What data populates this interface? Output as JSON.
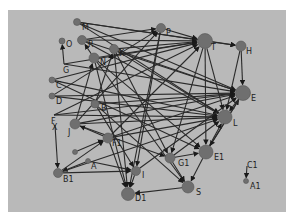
{
  "diagram": {
    "type": "directed-network-graph",
    "background": "#b9b9b9",
    "node_color": "#6f6f6f",
    "edge_color": "#2a2a2a",
    "nodes": [
      {
        "id": "M",
        "label": "M",
        "x": 77,
        "y": 22,
        "r": 3.5,
        "lx": 82,
        "ly": 30
      },
      {
        "id": "O",
        "label": "O",
        "x": 62,
        "y": 41,
        "r": 3.0,
        "lx": 66,
        "ly": 47
      },
      {
        "id": "R",
        "label": "R",
        "x": 82,
        "y": 40,
        "r": 4.5,
        "lx": 88,
        "ly": 47
      },
      {
        "id": "K",
        "label": "K",
        "x": 114,
        "y": 49,
        "r": 4.5,
        "lx": 119,
        "ly": 56
      },
      {
        "id": "N",
        "label": "N",
        "x": 94,
        "y": 58,
        "r": 5.0,
        "lx": 100,
        "ly": 65
      },
      {
        "id": "P",
        "label": "P",
        "x": 161,
        "y": 28,
        "r": 4.5,
        "lx": 166,
        "ly": 35
      },
      {
        "id": "T",
        "label": "T",
        "x": 205,
        "y": 41,
        "r": 7.5,
        "lx": 211,
        "ly": 50
      },
      {
        "id": "H",
        "label": "H",
        "x": 241,
        "y": 46,
        "r": 5.0,
        "lx": 246,
        "ly": 54
      },
      {
        "id": "E",
        "label": "E",
        "x": 243,
        "y": 93,
        "r": 7.5,
        "lx": 251,
        "ly": 101
      },
      {
        "id": "L",
        "label": "L",
        "x": 225,
        "y": 117,
        "r": 7.0,
        "lx": 233,
        "ly": 126
      },
      {
        "id": "G",
        "label": "G",
        "x": 64,
        "y": 64,
        "r": 0,
        "lx": 63,
        "ly": 73
      },
      {
        "id": "C",
        "label": "C",
        "x": 52,
        "y": 80,
        "r": 3.0,
        "lx": 56,
        "ly": 88
      },
      {
        "id": "D",
        "label": "D",
        "x": 52,
        "y": 96,
        "r": 3.0,
        "lx": 56,
        "ly": 104
      },
      {
        "id": "B",
        "label": "B",
        "x": 95,
        "y": 104,
        "r": 4.0,
        "lx": 101,
        "ly": 111
      },
      {
        "id": "F",
        "label": "F",
        "x": 54,
        "y": 115,
        "r": 0,
        "lx": 51,
        "ly": 124
      },
      {
        "id": "X",
        "label": "X",
        "x": 55,
        "y": 125,
        "r": 0,
        "lx": 52,
        "ly": 130
      },
      {
        "id": "J",
        "label": "J",
        "x": 75,
        "y": 124,
        "r": 5.0,
        "lx": 68,
        "ly": 135
      },
      {
        "id": "F1",
        "label": "F1",
        "x": 108,
        "y": 138,
        "r": 5.0,
        "lx": 112,
        "ly": 146
      },
      {
        "id": "Q",
        "label": "",
        "x": 75,
        "y": 152,
        "r": 2.5,
        "lx": 0,
        "ly": 0
      },
      {
        "id": "A",
        "label": "A",
        "x": 88,
        "y": 161,
        "r": 2.5,
        "lx": 91,
        "ly": 169
      },
      {
        "id": "B1",
        "label": "B1",
        "x": 58,
        "y": 173,
        "r": 4.5,
        "lx": 63,
        "ly": 182
      },
      {
        "id": "I",
        "label": "I",
        "x": 136,
        "y": 171,
        "r": 4.5,
        "lx": 142,
        "ly": 178
      },
      {
        "id": "D1",
        "label": "D1",
        "x": 128,
        "y": 194,
        "r": 6.5,
        "lx": 135,
        "ly": 201
      },
      {
        "id": "G1",
        "label": "G1",
        "x": 170,
        "y": 158,
        "r": 5.0,
        "lx": 178,
        "ly": 166
      },
      {
        "id": "E1",
        "label": "E1",
        "x": 206,
        "y": 152,
        "r": 7.0,
        "lx": 214,
        "ly": 160
      },
      {
        "id": "S",
        "label": "S",
        "x": 188,
        "y": 187,
        "r": 6.0,
        "lx": 196,
        "ly": 195
      },
      {
        "id": "C1",
        "label": "C1",
        "x": 247,
        "y": 166,
        "r": 0,
        "lx": 247,
        "ly": 168
      },
      {
        "id": "A1",
        "label": "A1",
        "x": 246,
        "y": 181,
        "r": 2.5,
        "lx": 250,
        "ly": 189
      }
    ],
    "edges": [
      [
        "M",
        "T"
      ],
      [
        "M",
        "E"
      ],
      [
        "M",
        "H"
      ],
      [
        "M",
        "L"
      ],
      [
        "R",
        "P"
      ],
      [
        "R",
        "E"
      ],
      [
        "R",
        "L"
      ],
      [
        "R",
        "T"
      ],
      [
        "K",
        "T"
      ],
      [
        "K",
        "E"
      ],
      [
        "K",
        "G1"
      ],
      [
        "K",
        "D1"
      ],
      [
        "K",
        "L"
      ],
      [
        "N",
        "R"
      ],
      [
        "N",
        "T"
      ],
      [
        "N",
        "E1"
      ],
      [
        "N",
        "S"
      ],
      [
        "N",
        "D1"
      ],
      [
        "P",
        "T"
      ],
      [
        "P",
        "D1"
      ],
      [
        "P",
        "I"
      ],
      [
        "T",
        "H"
      ],
      [
        "T",
        "E1"
      ],
      [
        "T",
        "G1"
      ],
      [
        "T",
        "L"
      ],
      [
        "H",
        "E"
      ],
      [
        "H",
        "L"
      ],
      [
        "G",
        "O"
      ],
      [
        "G",
        "T"
      ],
      [
        "G",
        "E"
      ],
      [
        "C",
        "T"
      ],
      [
        "C",
        "L"
      ],
      [
        "C",
        "E1"
      ],
      [
        "D",
        "E"
      ],
      [
        "D",
        "P"
      ],
      [
        "D",
        "L"
      ],
      [
        "B",
        "K"
      ],
      [
        "B",
        "E"
      ],
      [
        "B",
        "S"
      ],
      [
        "B",
        "I"
      ],
      [
        "F",
        "T"
      ],
      [
        "F",
        "E"
      ],
      [
        "F",
        "L"
      ],
      [
        "X",
        "B1"
      ],
      [
        "J",
        "N"
      ],
      [
        "J",
        "P"
      ],
      [
        "J",
        "E"
      ],
      [
        "J",
        "L"
      ],
      [
        "J",
        "G1"
      ],
      [
        "F1",
        "T"
      ],
      [
        "F1",
        "E"
      ],
      [
        "F1",
        "L"
      ],
      [
        "F1",
        "D1"
      ],
      [
        "F1",
        "J"
      ],
      [
        "Q",
        "F1"
      ],
      [
        "A",
        "I"
      ],
      [
        "A",
        "B1"
      ],
      [
        "B1",
        "L"
      ],
      [
        "B1",
        "F1"
      ],
      [
        "B1",
        "I"
      ],
      [
        "I",
        "D1"
      ],
      [
        "I",
        "E"
      ],
      [
        "G1",
        "E1"
      ],
      [
        "G1",
        "S"
      ],
      [
        "G1",
        "L"
      ],
      [
        "E1",
        "S"
      ],
      [
        "E1",
        "L"
      ],
      [
        "E1",
        "E"
      ],
      [
        "S",
        "D1"
      ],
      [
        "E",
        "L"
      ],
      [
        "E",
        "E1"
      ],
      [
        "C1",
        "A1"
      ]
    ]
  }
}
